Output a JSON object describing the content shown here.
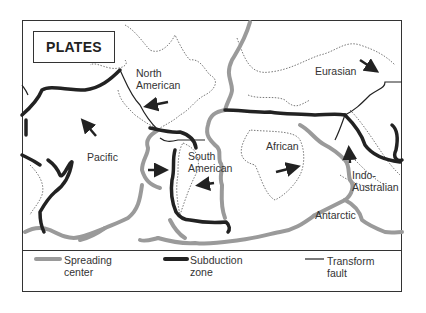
{
  "title": "PLATES",
  "plates": [
    {
      "name": "North American",
      "lines": [
        "North",
        "American"
      ]
    },
    {
      "name": "Eurasian",
      "lines": [
        "Eurasian"
      ]
    },
    {
      "name": "Pacific",
      "lines": [
        "Pacific"
      ]
    },
    {
      "name": "South American",
      "lines": [
        "South",
        "American"
      ]
    },
    {
      "name": "African",
      "lines": [
        "African"
      ]
    },
    {
      "name": "Indo-Australian",
      "lines": [
        "Indo-",
        "Australian"
      ]
    },
    {
      "name": "Antarctic",
      "lines": [
        "Antarctic"
      ]
    }
  ],
  "legend": [
    {
      "label_line1": "Spreading",
      "label_line2": "center",
      "color": "#999999",
      "style": "thick-gray"
    },
    {
      "label_line1": "Subduction",
      "label_line2": "zone",
      "color": "#222222",
      "style": "thick-black"
    },
    {
      "label_line1": "Transform",
      "label_line2": "fault",
      "color": "#222222",
      "style": "thin-black"
    }
  ],
  "colors": {
    "spreading": "#9a9a9a",
    "subduction": "#222222",
    "transform": "#222222",
    "coast": "#555555"
  }
}
